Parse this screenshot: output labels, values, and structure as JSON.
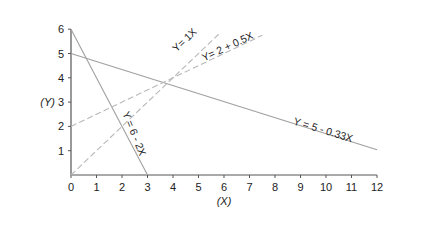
{
  "chart_data": {
    "type": "line",
    "title": "",
    "xlabel": "(X)",
    "ylabel": "(Y)",
    "xlim": [
      0,
      12
    ],
    "ylim": [
      0,
      6
    ],
    "x_ticks": [
      "0",
      "1",
      "2",
      "3",
      "4",
      "5",
      "6",
      "7",
      "8",
      "9",
      "10",
      "11",
      "12"
    ],
    "y_ticks": [
      "1",
      "2",
      "3",
      "4",
      "5",
      "6"
    ],
    "grid": false,
    "legend": "none (inline labels)",
    "series": [
      {
        "name": "Y = 6 - 2X",
        "intercept": 6,
        "slope": -2,
        "style": "solid",
        "color": "#a0a0a0",
        "x": [
          0,
          3
        ],
        "y": [
          6,
          0
        ]
      },
      {
        "name": "Y = 5 - 0.33X",
        "intercept": 5,
        "slope": -0.33,
        "style": "solid",
        "color": "#a0a0a0",
        "x": [
          0,
          12
        ],
        "y": [
          5,
          1.04
        ]
      },
      {
        "name": "Y= 1X",
        "intercept": 0,
        "slope": 1,
        "style": "dashed",
        "color": "#b8b8b8",
        "x": [
          0,
          5.8
        ],
        "y": [
          0,
          5.8
        ]
      },
      {
        "name": "Y= 2 + 0.5X",
        "intercept": 2,
        "slope": 0.5,
        "style": "dashed",
        "color": "#b8b8b8",
        "x": [
          0,
          7.5
        ],
        "y": [
          2,
          5.75
        ]
      }
    ]
  }
}
